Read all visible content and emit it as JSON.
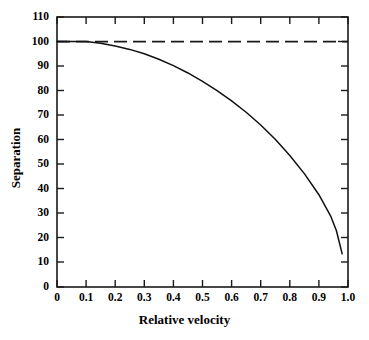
{
  "chart_data": {
    "type": "line",
    "title": "",
    "xlabel": "Relative velocity",
    "ylabel": "Separation",
    "xlim": [
      0,
      1.0
    ],
    "ylim": [
      0,
      110
    ],
    "grid": false,
    "legend": "none",
    "frame": "box",
    "tick_direction": "in",
    "xticks": [
      0,
      0.1,
      0.2,
      0.3,
      0.4,
      0.5,
      0.6,
      0.7,
      0.8,
      0.9,
      1.0
    ],
    "xtick_labels": [
      "0",
      "0.1",
      "0.2",
      "0.3",
      "0.4",
      "0.5",
      "0.6",
      "0.7",
      "0.8",
      "0.9",
      "1.0"
    ],
    "yticks": [
      0,
      10,
      20,
      30,
      40,
      50,
      60,
      70,
      80,
      90,
      100,
      110
    ],
    "ytick_labels": [
      "0",
      "10",
      "20",
      "30",
      "40",
      "50",
      "60",
      "70",
      "80",
      "90",
      "100",
      "110"
    ],
    "series": [
      {
        "name": "separation-curve",
        "style": "solid",
        "color": "#000000",
        "x": [
          0.0,
          0.05,
          0.1,
          0.15,
          0.2,
          0.25,
          0.3,
          0.35,
          0.4,
          0.45,
          0.5,
          0.55,
          0.6,
          0.65,
          0.7,
          0.75,
          0.8,
          0.85,
          0.9,
          0.94,
          0.96,
          0.98
        ],
        "values": [
          100.0,
          100.0,
          100.0,
          99.3,
          98.2,
          96.8,
          95.0,
          92.8,
          90.2,
          87.2,
          83.8,
          80.0,
          75.8,
          71.2,
          66.0,
          60.2,
          53.6,
          46.2,
          37.6,
          29.0,
          23.0,
          13.5
        ]
      },
      {
        "name": "reference-line",
        "style": "dashed",
        "color": "#000000",
        "x": [
          0.0,
          1.0
        ],
        "values": [
          100,
          100
        ]
      }
    ]
  },
  "axes": {
    "x_label": "Relative velocity",
    "y_label": "Separation"
  }
}
